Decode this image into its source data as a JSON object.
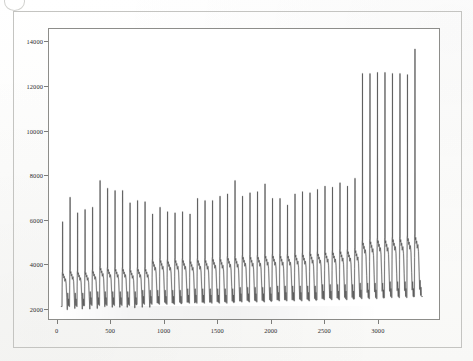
{
  "figure": {
    "corner_glyph": "circle-annotation-icon",
    "background_color": "#ffffff",
    "border_color": "#c4c4c1",
    "plot_frame_color": "#8d8d8a"
  },
  "chart_data": {
    "type": "line",
    "title": "",
    "subtitle": "",
    "xlabel": "",
    "ylabel": "",
    "xlim": [
      -80,
      3580
    ],
    "ylim": [
      1500,
      14600
    ],
    "grid": false,
    "legend": null,
    "line_color": "#4a4a4a",
    "x_ticks": [
      0,
      500,
      1000,
      1500,
      2000,
      2500,
      3000
    ],
    "x_tick_labels": [
      "0",
      "500",
      "1000",
      "1500",
      "2000",
      "2500",
      "3000"
    ],
    "y_ticks": [
      2000,
      4000,
      6000,
      8000,
      10000,
      12000,
      14000
    ],
    "y_tick_labels": [
      "2000",
      "4000",
      "6000",
      "8000",
      "10000",
      "12000",
      "14000"
    ],
    "series": [
      {
        "name": "signal",
        "description": "periodic sawtooth-like burst signal, 48 cycles, baseline near 2200 with sharp upward spikes",
        "baseline": 2200,
        "cycle_count": 48,
        "cycle_period": 70,
        "cycle_start_x": 40,
        "spike_peaks": [
          5950,
          7050,
          6350,
          6500,
          6600,
          7800,
          7450,
          7350,
          7350,
          6800,
          6900,
          6850,
          6300,
          6600,
          6400,
          6350,
          6400,
          6300,
          7000,
          6900,
          6900,
          7100,
          7200,
          7800,
          7100,
          7250,
          7300,
          7650,
          7000,
          7000,
          6700,
          7200,
          7300,
          7250,
          7400,
          7550,
          7500,
          7700,
          7550,
          7900,
          12600,
          12600,
          12650,
          12650,
          12600,
          12600,
          12550,
          13700
        ],
        "shoulder_levels": [
          3650,
          3750,
          3700,
          3700,
          3750,
          3900,
          3850,
          3850,
          3850,
          3800,
          3850,
          3850,
          4200,
          4250,
          4200,
          4250,
          4250,
          4200,
          4250,
          4250,
          4300,
          4300,
          4350,
          4350,
          4400,
          4400,
          4400,
          4450,
          4450,
          4450,
          4450,
          4500,
          4500,
          4550,
          4550,
          4600,
          4600,
          4650,
          4650,
          4700,
          5050,
          5100,
          5150,
          5150,
          5200,
          5200,
          5250,
          5300
        ],
        "trough_values": [
          2150,
          2150,
          2150,
          2200,
          2200,
          2200,
          2200,
          2200,
          2200,
          2200,
          2250,
          2250,
          2250,
          2250,
          2250,
          2250,
          2300,
          2300,
          2300,
          2300,
          2300,
          2300,
          2300,
          2350,
          2350,
          2350,
          2350,
          2350,
          2400,
          2400,
          2400,
          2400,
          2400,
          2400,
          2450,
          2450,
          2450,
          2450,
          2450,
          2500,
          2500,
          2500,
          2500,
          2550,
          2550,
          2550,
          2550,
          2600
        ]
      }
    ]
  }
}
